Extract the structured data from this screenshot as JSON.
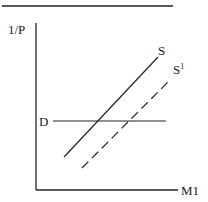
{
  "diagram": {
    "axis_y_label": "1/P",
    "axis_x_label": "M1",
    "demand_label": "D",
    "supply_label": "S",
    "supply_shifted_label": "S",
    "supply_shifted_superscript": "1",
    "line_color": "#222222"
  }
}
